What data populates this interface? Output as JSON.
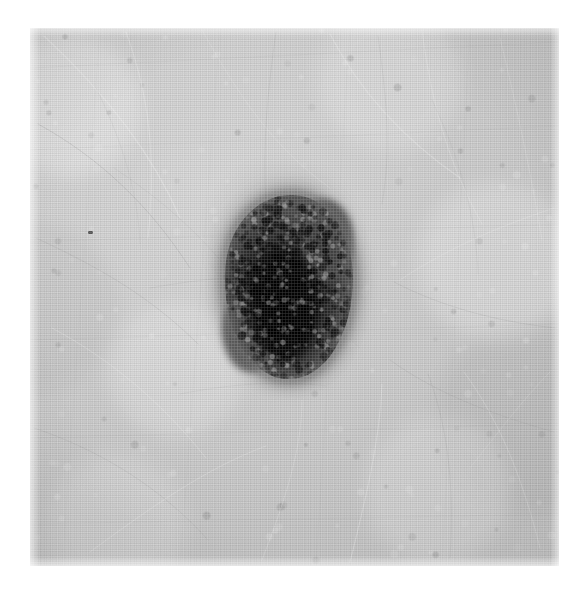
{
  "page": {
    "background_color": "#ffffff",
    "width": 587,
    "height": 591,
    "caption": "",
    "margin_top": 28,
    "margin_left": 30,
    "margin_right": 28,
    "margin_bottom": 25
  },
  "photo": {
    "alt": "Grayscale clinical photograph of a pigmented skin lesion on hairy skin",
    "modality": "clinical-photograph",
    "color_mode": "grayscale",
    "plate": {
      "x": 30,
      "y": 28,
      "width": 529,
      "height": 538
    },
    "background_tone_hex": "#cbcbcb",
    "highlight_tone_hex": "#dcdcdc",
    "shadow_tone_hex": "#bdbdbd"
  },
  "skin": {
    "label": "surrounding skin",
    "description": "light grey skin with fine criss-crossing furrows and scattered fine hairs",
    "base_hex": "#cbcbcb",
    "furrow_hex": "#9a9a9a",
    "hair_highlight_hex": "#f0f0f0",
    "texture": "fine vertical film grain with halftone lattice"
  },
  "lesion": {
    "label": "pigmented skin lesion",
    "shape": "ovoid, slightly lobulated, vertically elongated",
    "border": "irregular, feathered / fading at the periphery",
    "position": {
      "x": 225,
      "y": 195,
      "width": 128,
      "height": 184
    },
    "center": {
      "x": 289,
      "y": 287
    },
    "core_hex": "#060606",
    "body_hex": "#2e2e2e",
    "rim_hex": "#5a5a5a",
    "halo_hex": "#8f8d8a",
    "features": [
      "near-black central blotch offset below and left of centre",
      "granular globular pigment over the periphery",
      "small notch on the upper-right margin",
      "lighter grey shoulder at the lower-left"
    ]
  },
  "markings": {
    "stray_speck": {
      "label": "small dark speck on plain skin",
      "position": {
        "x": 88,
        "y": 231
      },
      "color_hex": "#3a3a3a"
    }
  },
  "hairs": [
    {
      "d": "M 14 8 C 70 60, 120 120, 150 190",
      "w": 1.1,
      "o": 0.4,
      "c": "#efefef"
    },
    {
      "d": "M 96 4 C 120 70, 126 130, 118 210",
      "w": 1.0,
      "o": 0.36,
      "c": "#f2f2f2"
    },
    {
      "d": "M 172 2 C 210 70, 244 120, 300 160",
      "w": 1.0,
      "o": 0.3,
      "c": "#e9e9e9"
    },
    {
      "d": "M 300 6 C 330 64, 372 110, 430 150",
      "w": 1.2,
      "o": 0.34,
      "c": "#f1f1f1"
    },
    {
      "d": "M 392 2 C 400 64, 414 128, 452 196",
      "w": 1.0,
      "o": 0.3,
      "c": "#ededed"
    },
    {
      "d": "M 470 10 C 486 76, 500 140, 512 212",
      "w": 1.0,
      "o": 0.28,
      "c": "#eaeaea"
    },
    {
      "d": "M 8 96 C 70 130, 120 178, 160 240",
      "w": 0.9,
      "o": 0.3,
      "c": "#8f8f8f"
    },
    {
      "d": "M 6 210 C 62 236, 118 266, 168 316",
      "w": 0.9,
      "o": 0.26,
      "c": "#969696"
    },
    {
      "d": "M 22 300 C 78 330, 130 372, 176 430",
      "w": 1.0,
      "o": 0.3,
      "c": "#efefef"
    },
    {
      "d": "M 4 400 C 64 420, 128 456, 178 512",
      "w": 0.9,
      "o": 0.26,
      "c": "#9b9b9b"
    },
    {
      "d": "M 60 524 C 120 480, 176 440, 236 418",
      "w": 1.0,
      "o": 0.3,
      "c": "#f0f0f0"
    },
    {
      "d": "M 232 532 C 256 470, 272 420, 272 372",
      "w": 1.0,
      "o": 0.28,
      "c": "#ededed"
    },
    {
      "d": "M 320 534 C 336 470, 350 412, 352 356",
      "w": 1.1,
      "o": 0.32,
      "c": "#f2f2f2"
    },
    {
      "d": "M 420 530 C 424 466, 420 404, 398 346",
      "w": 0.9,
      "o": 0.26,
      "c": "#9a9a9a"
    },
    {
      "d": "M 510 520 C 494 456, 472 396, 434 344",
      "w": 1.0,
      "o": 0.28,
      "c": "#ececec"
    },
    {
      "d": "M 524 404 C 468 388, 410 368, 360 332",
      "w": 0.9,
      "o": 0.26,
      "c": "#999999"
    },
    {
      "d": "M 526 300 C 470 294, 414 280, 364 254",
      "w": 0.9,
      "o": 0.24,
      "c": "#949494"
    },
    {
      "d": "M 524 180 C 470 198, 418 220, 370 252",
      "w": 1.0,
      "o": 0.28,
      "c": "#eeeeee"
    },
    {
      "d": "M 246 4 C 238 60, 232 118, 236 178",
      "w": 0.9,
      "o": 0.24,
      "c": "#9d9d9d"
    },
    {
      "d": "M 348 8 C 356 66, 362 120, 352 176",
      "w": 0.9,
      "o": 0.24,
      "c": "#a0a0a0"
    },
    {
      "d": "M 120 260 C 176 250, 220 246, 262 252",
      "w": 0.8,
      "o": 0.22,
      "c": "#9e9e9e"
    },
    {
      "d": "M 150 366 C 200 356, 250 352, 296 358",
      "w": 0.8,
      "o": 0.22,
      "c": "#a2a2a2"
    },
    {
      "d": "M 402 72 C 430 130, 446 188, 448 246",
      "w": 0.8,
      "o": 0.22,
      "c": "#a4a4a4"
    },
    {
      "d": "M 66 60 C 92 112, 108 164, 110 216",
      "w": 0.8,
      "o": 0.22,
      "c": "#a6a6a6"
    },
    {
      "d": "M 440 440 C 470 402, 496 368, 520 344",
      "w": 0.8,
      "o": 0.24,
      "c": "#e8e8e8"
    },
    {
      "d": "M 84 140 C 132 172, 170 206, 200 244",
      "w": 0.8,
      "o": 0.22,
      "c": "#a3a3a3"
    },
    {
      "d": "M 244 200 C 266 244, 278 296, 276 348",
      "w": 1.0,
      "o": 0.55,
      "c": "#d8d8d8"
    },
    {
      "d": "M 262 192 C 246 238, 238 288, 244 342",
      "w": 0.9,
      "o": 0.4,
      "c": "#c8c8c8"
    },
    {
      "d": "M 300 206 C 312 252, 314 302, 302 350",
      "w": 0.9,
      "o": 0.45,
      "c": "#cfcfcf"
    },
    {
      "d": "M 218 246 C 256 268, 296 288, 330 320",
      "w": 0.8,
      "o": 0.32,
      "c": "#bdbdbd"
    }
  ],
  "furrows": [
    {
      "d": "M 0 40 L 529 14",
      "w": 0.6,
      "o": 0.12,
      "c": "#8e8e8e"
    },
    {
      "d": "M 0 122 L 529 98",
      "w": 0.6,
      "o": 0.1,
      "c": "#8e8e8e"
    },
    {
      "d": "M 0 214 L 529 196",
      "w": 0.6,
      "o": 0.1,
      "c": "#8e8e8e"
    },
    {
      "d": "M 0 312 L 529 296",
      "w": 0.6,
      "o": 0.1,
      "c": "#8e8e8e"
    },
    {
      "d": "M 0 410 L 529 396",
      "w": 0.6,
      "o": 0.1,
      "c": "#8e8e8e"
    },
    {
      "d": "M 0 496 L 529 486",
      "w": 0.6,
      "o": 0.1,
      "c": "#8e8e8e"
    },
    {
      "d": "M 70 0 L 32 538",
      "w": 0.5,
      "o": 0.09,
      "c": "#909090"
    },
    {
      "d": "M 190 0 L 150 538",
      "w": 0.5,
      "o": 0.09,
      "c": "#909090"
    },
    {
      "d": "M 320 0 L 286 538",
      "w": 0.5,
      "o": 0.09,
      "c": "#909090"
    },
    {
      "d": "M 440 0 L 412 538",
      "w": 0.5,
      "o": 0.09,
      "c": "#909090"
    }
  ]
}
